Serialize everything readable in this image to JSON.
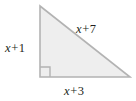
{
  "figure": {
    "type": "right-triangle-diagram",
    "background_color": "#ffffff",
    "fill_color": "#eeeeee",
    "stroke_color": "#b3b3b3",
    "text_color": "#231f20",
    "vertices": {
      "apex": [
        40,
        6
      ],
      "bottom_left": [
        40,
        77
      ],
      "bottom_right": [
        130,
        77
      ]
    },
    "right_angle_marker": {
      "present": true,
      "corner": "bottom-left",
      "size_px": 10
    },
    "labels": {
      "vertical_leg": {
        "variable": "x",
        "operator": "+",
        "constant": "1",
        "full": "x + 1"
      },
      "hypotenuse": {
        "variable": "x",
        "operator": "+",
        "constant": "7",
        "full": "x + 7"
      },
      "horizontal_leg": {
        "variable": "x",
        "operator": "+",
        "constant": "3",
        "full": "x + 3"
      }
    }
  }
}
